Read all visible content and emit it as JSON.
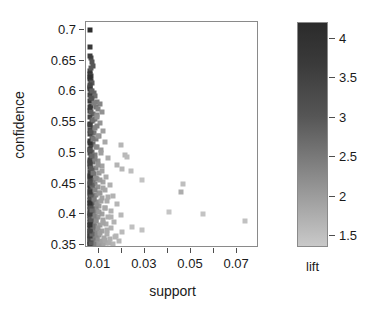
{
  "chart_data": {
    "type": "scatter",
    "title": "",
    "xlabel": "support",
    "ylabel": "confidence",
    "xlim": [
      0.0045,
      0.0795
    ],
    "ylim": [
      0.345,
      0.713
    ],
    "grid": false,
    "x_ticks": [
      0.01,
      0.02,
      0.03,
      0.04,
      0.05,
      0.06,
      0.07
    ],
    "x_tick_labels": [
      "0.01",
      "",
      "0.03",
      "",
      "0.05",
      "",
      "0.07"
    ],
    "y_ticks": [
      0.35,
      0.4,
      0.45,
      0.5,
      0.55,
      0.6,
      0.65,
      0.7
    ],
    "y_tick_labels": [
      "0.35",
      "0.4",
      "0.45",
      "0.5",
      "0.55",
      "0.6",
      "0.65",
      "0.7"
    ],
    "colorbar": {
      "label": "lift",
      "position": "right",
      "ticks": [
        1.5,
        2,
        2.5,
        3,
        3.5,
        4
      ],
      "tick_labels": [
        "1.5",
        "2",
        "2.5",
        "3",
        "3.5",
        "4"
      ],
      "vmin": 1.35,
      "vmax": 4.2,
      "low_color": "#c9c9c9",
      "high_color": "#2b2b2b"
    },
    "marker": "square",
    "marker_size_px": 5,
    "series_name": "rules",
    "point_fields": [
      "support",
      "confidence",
      "lift"
    ],
    "points": [
      [
        0.0063,
        0.7,
        4.15
      ],
      [
        0.0062,
        0.672,
        3.95
      ],
      [
        0.0065,
        0.655,
        3.6
      ],
      [
        0.007,
        0.648,
        3.45
      ],
      [
        0.0075,
        0.641,
        3.4
      ],
      [
        0.0064,
        0.634,
        3.9
      ],
      [
        0.0062,
        0.628,
        4.05
      ],
      [
        0.0068,
        0.625,
        3.7
      ],
      [
        0.0061,
        0.62,
        4.1
      ],
      [
        0.0066,
        0.617,
        3.8
      ],
      [
        0.0072,
        0.613,
        3.35
      ],
      [
        0.0062,
        0.608,
        4.0
      ],
      [
        0.006,
        0.604,
        4.05
      ],
      [
        0.0067,
        0.601,
        3.65
      ],
      [
        0.0078,
        0.598,
        3.1
      ],
      [
        0.0063,
        0.595,
        3.85
      ],
      [
        0.0085,
        0.592,
        2.95
      ],
      [
        0.0071,
        0.588,
        3.3
      ],
      [
        0.0062,
        0.585,
        3.95
      ],
      [
        0.0092,
        0.583,
        2.7
      ],
      [
        0.0104,
        0.58,
        2.55
      ],
      [
        0.0066,
        0.577,
        3.6
      ],
      [
        0.0088,
        0.574,
        2.85
      ],
      [
        0.0098,
        0.571,
        2.6
      ],
      [
        0.0061,
        0.568,
        4.0
      ],
      [
        0.0112,
        0.566,
        2.35
      ],
      [
        0.0077,
        0.563,
        3.05
      ],
      [
        0.0094,
        0.561,
        2.5
      ],
      [
        0.0063,
        0.558,
        3.75
      ],
      [
        0.0083,
        0.555,
        2.8
      ],
      [
        0.0069,
        0.552,
        3.4
      ],
      [
        0.0106,
        0.549,
        2.3
      ],
      [
        0.006,
        0.547,
        4.05
      ],
      [
        0.0091,
        0.544,
        2.55
      ],
      [
        0.0074,
        0.541,
        3.1
      ],
      [
        0.0064,
        0.538,
        3.65
      ],
      [
        0.0119,
        0.536,
        2.1
      ],
      [
        0.008,
        0.533,
        2.85
      ],
      [
        0.0062,
        0.53,
        3.9
      ],
      [
        0.0099,
        0.528,
        2.4
      ],
      [
        0.007,
        0.525,
        3.25
      ],
      [
        0.0086,
        0.522,
        2.65
      ],
      [
        0.0061,
        0.519,
        3.95
      ],
      [
        0.0126,
        0.517,
        1.95
      ],
      [
        0.0076,
        0.514,
        2.95
      ],
      [
        0.0066,
        0.512,
        3.5
      ],
      [
        0.0196,
        0.512,
        1.7
      ],
      [
        0.0093,
        0.509,
        2.45
      ],
      [
        0.006,
        0.506,
        4.1
      ],
      [
        0.0109,
        0.504,
        2.2
      ],
      [
        0.0072,
        0.501,
        3.15
      ],
      [
        0.0063,
        0.499,
        3.7
      ],
      [
        0.0215,
        0.497,
        1.65
      ],
      [
        0.0082,
        0.496,
        2.7
      ],
      [
        0.0222,
        0.494,
        1.6
      ],
      [
        0.0068,
        0.493,
        3.35
      ],
      [
        0.0141,
        0.491,
        1.85
      ],
      [
        0.0061,
        0.489,
        3.85
      ],
      [
        0.0096,
        0.487,
        2.35
      ],
      [
        0.0075,
        0.485,
        2.9
      ],
      [
        0.0064,
        0.482,
        3.55
      ],
      [
        0.0178,
        0.48,
        1.72
      ],
      [
        0.0115,
        0.479,
        2.05
      ],
      [
        0.006,
        0.477,
        4.0
      ],
      [
        0.0088,
        0.475,
        2.5
      ],
      [
        0.0203,
        0.473,
        1.68
      ],
      [
        0.007,
        0.472,
        3.2
      ],
      [
        0.024,
        0.471,
        1.55
      ],
      [
        0.0062,
        0.469,
        3.8
      ],
      [
        0.0102,
        0.467,
        2.25
      ],
      [
        0.0079,
        0.465,
        2.75
      ],
      [
        0.0065,
        0.463,
        3.45
      ],
      [
        0.0132,
        0.461,
        1.9
      ],
      [
        0.006,
        0.46,
        4.05
      ],
      [
        0.0091,
        0.458,
        2.45
      ],
      [
        0.0073,
        0.456,
        3.0
      ],
      [
        0.0286,
        0.455,
        1.45
      ],
      [
        0.0063,
        0.454,
        3.65
      ],
      [
        0.0119,
        0.452,
        2.0
      ],
      [
        0.0466,
        0.45,
        1.55
      ],
      [
        0.0084,
        0.45,
        2.6
      ],
      [
        0.0061,
        0.448,
        3.9
      ],
      [
        0.0148,
        0.447,
        1.8
      ],
      [
        0.0069,
        0.445,
        3.25
      ],
      [
        0.0097,
        0.444,
        2.3
      ],
      [
        0.006,
        0.442,
        4.1
      ],
      [
        0.0077,
        0.441,
        2.85
      ],
      [
        0.0128,
        0.439,
        1.92
      ],
      [
        0.0066,
        0.438,
        3.5
      ],
      [
        0.0457,
        0.436,
        1.85
      ],
      [
        0.0106,
        0.435,
        2.15
      ],
      [
        0.0062,
        0.434,
        3.75
      ],
      [
        0.0088,
        0.432,
        2.48
      ],
      [
        0.0072,
        0.43,
        3.1
      ],
      [
        0.0163,
        0.429,
        1.75
      ],
      [
        0.006,
        0.428,
        4.0
      ],
      [
        0.0115,
        0.426,
        2.02
      ],
      [
        0.0081,
        0.425,
        2.68
      ],
      [
        0.0064,
        0.423,
        3.58
      ],
      [
        0.0136,
        0.422,
        1.88
      ],
      [
        0.0094,
        0.42,
        2.38
      ],
      [
        0.0061,
        0.419,
        3.88
      ],
      [
        0.0074,
        0.418,
        2.92
      ],
      [
        0.0178,
        0.416,
        1.7
      ],
      [
        0.0067,
        0.415,
        3.38
      ],
      [
        0.0103,
        0.414,
        2.18
      ],
      [
        0.006,
        0.412,
        4.08
      ],
      [
        0.0086,
        0.411,
        2.55
      ],
      [
        0.0125,
        0.41,
        1.98
      ],
      [
        0.007,
        0.409,
        3.18
      ],
      [
        0.0063,
        0.408,
        3.68
      ],
      [
        0.0152,
        0.406,
        1.78
      ],
      [
        0.0091,
        0.405,
        2.42
      ],
      [
        0.0405,
        0.404,
        1.42
      ],
      [
        0.0076,
        0.404,
        2.8
      ],
      [
        0.0061,
        0.402,
        3.95
      ],
      [
        0.0112,
        0.401,
        2.08
      ],
      [
        0.0551,
        0.401,
        1.45
      ],
      [
        0.0065,
        0.4,
        3.48
      ],
      [
        0.0198,
        0.399,
        1.66
      ],
      [
        0.0082,
        0.398,
        2.62
      ],
      [
        0.006,
        0.397,
        4.12
      ],
      [
        0.0142,
        0.396,
        1.82
      ],
      [
        0.0098,
        0.395,
        2.28
      ],
      [
        0.0072,
        0.394,
        3.05
      ],
      [
        0.0063,
        0.392,
        3.72
      ],
      [
        0.0119,
        0.391,
        2.0
      ],
      [
        0.0088,
        0.39,
        2.45
      ],
      [
        0.0732,
        0.389,
        1.5
      ],
      [
        0.0061,
        0.388,
        3.92
      ],
      [
        0.0168,
        0.387,
        1.74
      ],
      [
        0.0078,
        0.386,
        2.72
      ],
      [
        0.0066,
        0.385,
        3.42
      ],
      [
        0.0131,
        0.384,
        1.9
      ],
      [
        0.0104,
        0.383,
        2.12
      ],
      [
        0.006,
        0.382,
        4.06
      ],
      [
        0.0084,
        0.381,
        2.52
      ],
      [
        0.0244,
        0.38,
        1.52
      ],
      [
        0.007,
        0.379,
        3.12
      ],
      [
        0.0155,
        0.378,
        1.76
      ],
      [
        0.0062,
        0.377,
        3.8
      ],
      [
        0.0093,
        0.376,
        2.32
      ],
      [
        0.0288,
        0.375,
        1.48
      ],
      [
        0.0074,
        0.374,
        2.88
      ],
      [
        0.0115,
        0.373,
        2.04
      ],
      [
        0.0064,
        0.372,
        3.55
      ],
      [
        0.0201,
        0.371,
        1.62
      ],
      [
        0.0086,
        0.37,
        2.48
      ],
      [
        0.006,
        0.369,
        4.1
      ],
      [
        0.0137,
        0.368,
        1.86
      ],
      [
        0.01,
        0.367,
        2.22
      ],
      [
        0.0071,
        0.366,
        3.08
      ],
      [
        0.0063,
        0.365,
        3.66
      ],
      [
        0.0176,
        0.364,
        1.7
      ],
      [
        0.0081,
        0.363,
        2.58
      ],
      [
        0.0122,
        0.362,
        1.96
      ],
      [
        0.0061,
        0.361,
        3.98
      ],
      [
        0.0148,
        0.36,
        1.8
      ],
      [
        0.0091,
        0.359,
        2.36
      ],
      [
        0.0067,
        0.358,
        3.32
      ],
      [
        0.0188,
        0.357,
        1.68
      ],
      [
        0.0076,
        0.356,
        2.76
      ],
      [
        0.006,
        0.355,
        4.14
      ],
      [
        0.0108,
        0.355,
        2.1
      ],
      [
        0.0132,
        0.354,
        1.88
      ],
      [
        0.007,
        0.353,
        3.15
      ],
      [
        0.0084,
        0.352,
        2.5
      ],
      [
        0.0062,
        0.352,
        3.85
      ],
      [
        0.016,
        0.351,
        1.73
      ],
      [
        0.0096,
        0.351,
        2.26
      ],
      [
        0.0073,
        0.35,
        2.98
      ],
      [
        0.0065,
        0.35,
        3.44
      ],
      [
        0.0118,
        0.35,
        2.02
      ],
      [
        0.0089,
        0.35,
        2.4
      ],
      [
        0.0079,
        0.351,
        2.66
      ],
      [
        0.006,
        0.351,
        4.02
      ],
      [
        0.0101,
        0.352,
        2.18
      ],
      [
        0.0143,
        0.353,
        1.83
      ],
      [
        0.0068,
        0.354,
        3.28
      ],
      [
        0.011,
        0.356,
        2.06
      ],
      [
        0.0125,
        0.358,
        1.94
      ],
      [
        0.0064,
        0.359,
        3.6
      ],
      [
        0.0093,
        0.36,
        2.33
      ],
      [
        0.0077,
        0.362,
        2.79
      ],
      [
        0.0169,
        0.363,
        1.71
      ],
      [
        0.0061,
        0.364,
        3.9
      ],
      [
        0.0086,
        0.366,
        2.53
      ],
      [
        0.0071,
        0.368,
        3.11
      ],
      [
        0.0106,
        0.37,
        2.14
      ],
      [
        0.0063,
        0.373,
        3.7
      ],
      [
        0.0134,
        0.375,
        1.87
      ],
      [
        0.0097,
        0.378,
        2.27
      ],
      [
        0.0074,
        0.381,
        2.93
      ],
      [
        0.006,
        0.383,
        4.04
      ],
      [
        0.0117,
        0.386,
        2.01
      ],
      [
        0.0088,
        0.389,
        2.44
      ],
      [
        0.0066,
        0.392,
        3.4
      ],
      [
        0.0152,
        0.395,
        1.77
      ],
      [
        0.008,
        0.398,
        2.64
      ],
      [
        0.0062,
        0.401,
        3.82
      ],
      [
        0.0102,
        0.404,
        2.2
      ],
      [
        0.0072,
        0.407,
        3.06
      ],
      [
        0.0127,
        0.41,
        1.93
      ],
      [
        0.0065,
        0.413,
        3.52
      ],
      [
        0.0092,
        0.416,
        2.37
      ],
      [
        0.006,
        0.419,
        4.09
      ],
      [
        0.0111,
        0.422,
        2.07
      ],
      [
        0.0078,
        0.425,
        2.74
      ],
      [
        0.014,
        0.428,
        1.84
      ],
      [
        0.0068,
        0.431,
        3.3
      ],
      [
        0.0099,
        0.434,
        2.24
      ],
      [
        0.0061,
        0.437,
        3.93
      ],
      [
        0.0083,
        0.44,
        2.57
      ],
      [
        0.012,
        0.443,
        1.99
      ],
      [
        0.007,
        0.447,
        3.2
      ],
      [
        0.0064,
        0.451,
        3.56
      ],
      [
        0.0105,
        0.455,
        2.16
      ],
      [
        0.009,
        0.459,
        2.41
      ],
      [
        0.006,
        0.463,
        4.07
      ],
      [
        0.0075,
        0.467,
        2.87
      ],
      [
        0.0114,
        0.471,
        2.03
      ],
      [
        0.0067,
        0.475,
        3.36
      ],
      [
        0.0095,
        0.48,
        2.31
      ],
      [
        0.0062,
        0.485,
        3.78
      ],
      [
        0.0082,
        0.49,
        2.61
      ],
      [
        0.0071,
        0.495,
        3.14
      ],
      [
        0.0108,
        0.5,
        2.11
      ],
      [
        0.0064,
        0.505,
        3.54
      ],
      [
        0.0088,
        0.51,
        2.46
      ],
      [
        0.006,
        0.516,
        4.03
      ],
      [
        0.0076,
        0.522,
        2.82
      ],
      [
        0.0098,
        0.528,
        2.25
      ],
      [
        0.0066,
        0.534,
        3.43
      ],
      [
        0.0085,
        0.54,
        2.58
      ],
      [
        0.0062,
        0.546,
        3.84
      ],
      [
        0.0073,
        0.553,
        2.99
      ],
      [
        0.0093,
        0.559,
        2.34
      ],
      [
        0.0068,
        0.566,
        3.26
      ],
      [
        0.0061,
        0.574,
        3.96
      ],
      [
        0.008,
        0.581,
        2.69
      ],
      [
        0.0065,
        0.59,
        3.46
      ],
      [
        0.007,
        0.6,
        3.22
      ],
      [
        0.0063,
        0.611,
        3.74
      ],
      [
        0.006,
        0.624,
        4.11
      ],
      [
        0.0067,
        0.638,
        3.39
      ],
      [
        0.0062,
        0.658,
        3.87
      ]
    ]
  }
}
